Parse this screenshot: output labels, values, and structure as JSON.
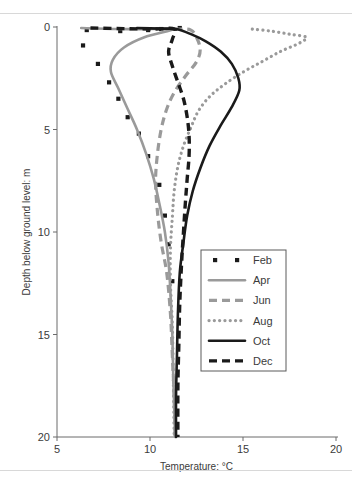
{
  "figure": {
    "background": "#ffffff",
    "frame_color": "#d8d8d8",
    "axis_color": "#6b6b6b",
    "text_color": "#3b3b3b"
  },
  "chart_data": {
    "type": "line",
    "title": "",
    "xlabel": "Temperature: °C",
    "ylabel": "Depth below ground level: m",
    "xlim": [
      5,
      20
    ],
    "ylim": [
      20,
      0
    ],
    "y_inverted": true,
    "grid": false,
    "xticks": [
      5,
      10,
      15,
      20
    ],
    "yticks": [
      0,
      5,
      10,
      15,
      20
    ],
    "xtick_labels": [
      "5",
      "10",
      "15",
      "20"
    ],
    "ytick_labels": [
      "0",
      "5",
      "10",
      "15",
      "20"
    ],
    "legend_position": "center-right",
    "legend_entries": [
      "Feb",
      "Apr",
      "Jun",
      "Aug",
      "Oct",
      "Dec"
    ],
    "colors": {
      "black": "#1a1a1a",
      "gray": "#9a9a9a"
    },
    "series": [
      {
        "name": "Feb",
        "style": "scatter",
        "color": "#1a1a1a",
        "marker": "square",
        "points": [
          [
            6.6,
            0.15
          ],
          [
            8.4,
            0.2
          ],
          [
            9.9,
            0.15
          ],
          [
            10.6,
            0.1
          ],
          [
            11.6,
            0.05
          ],
          [
            6.4,
            0.9
          ],
          [
            7.2,
            1.8
          ],
          [
            7.8,
            2.7
          ],
          [
            8.3,
            3.5
          ],
          [
            8.8,
            4.4
          ],
          [
            9.4,
            5.2
          ],
          [
            9.9,
            6.3
          ],
          [
            10.5,
            7.7
          ],
          [
            10.8,
            9.2
          ],
          [
            11.0,
            10.6
          ],
          [
            11.2,
            12.4
          ]
        ]
      },
      {
        "name": "Apr",
        "style": "solid",
        "color": "#9a9a9a",
        "points": [
          [
            6.3,
            0.05
          ],
          [
            8.2,
            0.1
          ],
          [
            10.0,
            0.1
          ],
          [
            11.3,
            0.1
          ],
          [
            9.7,
            0.5
          ],
          [
            8.6,
            1.0
          ],
          [
            8.0,
            1.6
          ],
          [
            7.9,
            2.2
          ],
          [
            8.3,
            3.0
          ],
          [
            8.8,
            4.0
          ],
          [
            9.3,
            5.0
          ],
          [
            9.8,
            6.2
          ],
          [
            10.2,
            7.4
          ],
          [
            10.5,
            8.6
          ],
          [
            10.8,
            10.0
          ],
          [
            11.0,
            11.5
          ],
          [
            11.1,
            13.0
          ],
          [
            11.2,
            15.0
          ],
          [
            11.25,
            17.0
          ],
          [
            11.3,
            18.5
          ],
          [
            11.35,
            20.0
          ]
        ]
      },
      {
        "name": "Jun",
        "style": "dashed",
        "color": "#9a9a9a",
        "points": [
          [
            10.6,
            0.1
          ],
          [
            11.6,
            0.1
          ],
          [
            12.2,
            0.15
          ],
          [
            12.5,
            0.5
          ],
          [
            12.7,
            1.1
          ],
          [
            12.5,
            1.7
          ],
          [
            11.9,
            2.4
          ],
          [
            11.3,
            3.2
          ],
          [
            10.9,
            4.0
          ],
          [
            10.6,
            5.0
          ],
          [
            10.4,
            6.2
          ],
          [
            10.3,
            7.5
          ],
          [
            10.4,
            9.0
          ],
          [
            10.6,
            10.5
          ],
          [
            10.9,
            12.0
          ],
          [
            11.1,
            14.0
          ],
          [
            11.2,
            16.0
          ],
          [
            11.3,
            18.0
          ],
          [
            11.35,
            20.0
          ]
        ]
      },
      {
        "name": "Aug",
        "style": "dotted",
        "color": "#9a9a9a",
        "points": [
          [
            15.5,
            0.1
          ],
          [
            16.5,
            0.2
          ],
          [
            17.5,
            0.35
          ],
          [
            18.4,
            0.5
          ],
          [
            18.0,
            0.8
          ],
          [
            17.0,
            1.2
          ],
          [
            16.0,
            1.7
          ],
          [
            15.0,
            2.2
          ],
          [
            14.0,
            2.8
          ],
          [
            13.2,
            3.4
          ],
          [
            12.6,
            4.1
          ],
          [
            12.2,
            4.9
          ],
          [
            11.8,
            5.8
          ],
          [
            11.5,
            6.8
          ],
          [
            11.3,
            8.0
          ],
          [
            11.2,
            9.3
          ],
          [
            11.1,
            10.8
          ],
          [
            11.1,
            12.5
          ],
          [
            11.2,
            14.5
          ],
          [
            11.25,
            17.0
          ],
          [
            11.3,
            20.0
          ]
        ]
      },
      {
        "name": "Oct",
        "style": "solid",
        "color": "#1a1a1a",
        "points": [
          [
            9.3,
            0.05
          ],
          [
            10.6,
            0.08
          ],
          [
            11.4,
            0.1
          ],
          [
            12.2,
            0.35
          ],
          [
            13.0,
            0.7
          ],
          [
            13.8,
            1.2
          ],
          [
            14.4,
            1.8
          ],
          [
            14.75,
            2.5
          ],
          [
            14.8,
            3.1
          ],
          [
            14.4,
            3.9
          ],
          [
            13.8,
            4.8
          ],
          [
            13.2,
            5.8
          ],
          [
            12.7,
            6.9
          ],
          [
            12.3,
            8.0
          ],
          [
            12.0,
            9.2
          ],
          [
            11.8,
            10.5
          ],
          [
            11.6,
            12.0
          ],
          [
            11.5,
            14.0
          ],
          [
            11.45,
            16.0
          ],
          [
            11.4,
            18.0
          ],
          [
            11.4,
            20.0
          ]
        ]
      },
      {
        "name": "Dec",
        "style": "dashed",
        "color": "#1a1a1a",
        "points": [
          [
            6.8,
            0.05
          ],
          [
            8.6,
            0.08
          ],
          [
            10.2,
            0.1
          ],
          [
            11.3,
            0.1
          ],
          [
            11.2,
            0.6
          ],
          [
            11.0,
            1.2
          ],
          [
            11.2,
            1.9
          ],
          [
            11.5,
            2.7
          ],
          [
            11.8,
            3.5
          ],
          [
            12.0,
            4.4
          ],
          [
            12.1,
            5.3
          ],
          [
            12.1,
            6.3
          ],
          [
            12.0,
            7.4
          ],
          [
            11.9,
            8.6
          ],
          [
            11.8,
            10.0
          ],
          [
            11.7,
            11.5
          ],
          [
            11.6,
            13.5
          ],
          [
            11.55,
            15.5
          ],
          [
            11.5,
            17.5
          ],
          [
            11.5,
            20.0
          ]
        ]
      }
    ]
  }
}
